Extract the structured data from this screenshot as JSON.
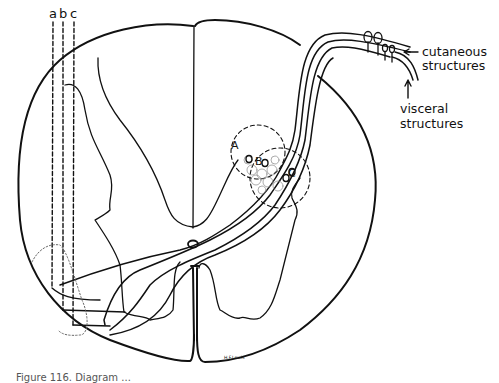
{
  "figure": {
    "type": "spinal-cord-cross-section-diagram",
    "colors": {
      "ink": "#111111",
      "background": "#ffffff",
      "dotted": "#555555"
    },
    "labels": {
      "tract_a": "a",
      "tract_b": "b",
      "tract_c": "c",
      "cell_group_A": "A",
      "cell_group_B": "B",
      "cell_group_C": "C",
      "cutaneous_line1": "cutaneous",
      "cutaneous_line2": "structures",
      "visceral_line1": "visceral",
      "visceral_line2": "structures",
      "cutaneous_arrow": "←",
      "visceral_arrow": "↑"
    },
    "signature": "H.F.Lewis",
    "caption_partial": "Figure 116. Diagram ..."
  }
}
